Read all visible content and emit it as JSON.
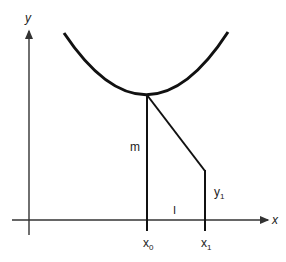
{
  "diagram": {
    "axes": {
      "x_label": "x",
      "y_label": "y"
    },
    "labels": {
      "m": "m",
      "y1": "y",
      "y1_sub": "1",
      "x0": "x",
      "x0_sub": "0",
      "x1": "x",
      "x1_sub": "1",
      "interval": "I"
    },
    "colors": {
      "stroke": "#111111",
      "axis": "#333333"
    }
  }
}
